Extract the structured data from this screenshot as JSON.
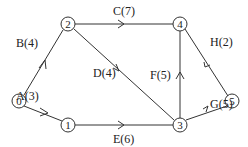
{
  "diagram": {
    "type": "directed-network",
    "nodes": [
      {
        "id": "0",
        "label": "0",
        "x": 19,
        "y": 101
      },
      {
        "id": "1",
        "label": "1",
        "x": 68,
        "y": 125
      },
      {
        "id": "2",
        "label": "2",
        "x": 68,
        "y": 24
      },
      {
        "id": "3",
        "label": "3",
        "x": 180,
        "y": 125
      },
      {
        "id": "4",
        "label": "4",
        "x": 180,
        "y": 24
      },
      {
        "id": "5",
        "label": "5",
        "x": 232,
        "y": 101
      }
    ],
    "edges": [
      {
        "from": "0",
        "to": "2",
        "label": "B(4)"
      },
      {
        "from": "0",
        "to": "1",
        "label": "A(3)"
      },
      {
        "from": "2",
        "to": "4",
        "label": "C(7)"
      },
      {
        "from": "2",
        "to": "3",
        "label": "D(4)"
      },
      {
        "from": "1",
        "to": "3",
        "label": "E(6)"
      },
      {
        "from": "3",
        "to": "4",
        "label": "F(5)"
      },
      {
        "from": "3",
        "to": "5",
        "label": "G(5)"
      },
      {
        "from": "4",
        "to": "5",
        "label": "H(2)"
      }
    ]
  }
}
